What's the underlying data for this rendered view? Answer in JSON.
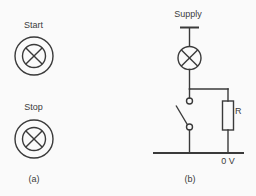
{
  "colors": {
    "background": "#fafafa",
    "ink": "#3a3a3a"
  },
  "panel_a": {
    "caption": "(a)",
    "start_label": "Start",
    "stop_label": "Stop",
    "symbols": [
      {
        "label": "Start",
        "icon": "indicator-lamp-icon"
      },
      {
        "label": "Stop",
        "icon": "indicator-lamp-icon"
      }
    ]
  },
  "panel_b": {
    "caption": "(b)",
    "supply_label": "Supply",
    "resistor_label": "R",
    "rail_label": "0 V",
    "component_icons": [
      "supply-terminal-icon",
      "lamp-icon",
      "switch-icon",
      "resistor-icon",
      "zero-volt-rail"
    ]
  }
}
